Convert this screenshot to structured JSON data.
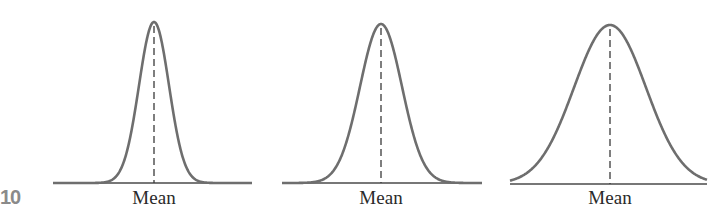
{
  "figure": {
    "number_label": "10",
    "curve_color": "#6e6e6e",
    "axis_color": "#4a4a4a",
    "mean_line_color": "#3a3a3a"
  },
  "chart_data": [
    {
      "type": "line",
      "title": "",
      "description": "Normal distribution, small spread (narrow, tall)",
      "xlabel": "Mean",
      "ylabel": "",
      "mean_label": "Mean",
      "layout": {
        "baseline_y": 183,
        "x_start": 53,
        "x_end": 252,
        "mean_x": 154,
        "peak_y": 22,
        "sigma_px": 15
      },
      "grid": false,
      "legend": false
    },
    {
      "type": "line",
      "title": "",
      "description": "Normal distribution, medium spread",
      "xlabel": "Mean",
      "ylabel": "",
      "mean_label": "Mean",
      "layout": {
        "baseline_y": 183,
        "x_start": 282,
        "x_end": 482,
        "mean_x": 381,
        "peak_y": 24,
        "sigma_px": 21
      },
      "grid": false,
      "legend": false
    },
    {
      "type": "line",
      "title": "",
      "description": "Normal distribution, large spread (wide, flat)",
      "xlabel": "Mean",
      "ylabel": "",
      "mean_label": "Mean",
      "layout": {
        "baseline_y": 184,
        "x_start": 510,
        "x_end": 707,
        "mean_x": 610,
        "peak_y": 25,
        "sigma_px": 36
      },
      "grid": false,
      "legend": false
    }
  ]
}
